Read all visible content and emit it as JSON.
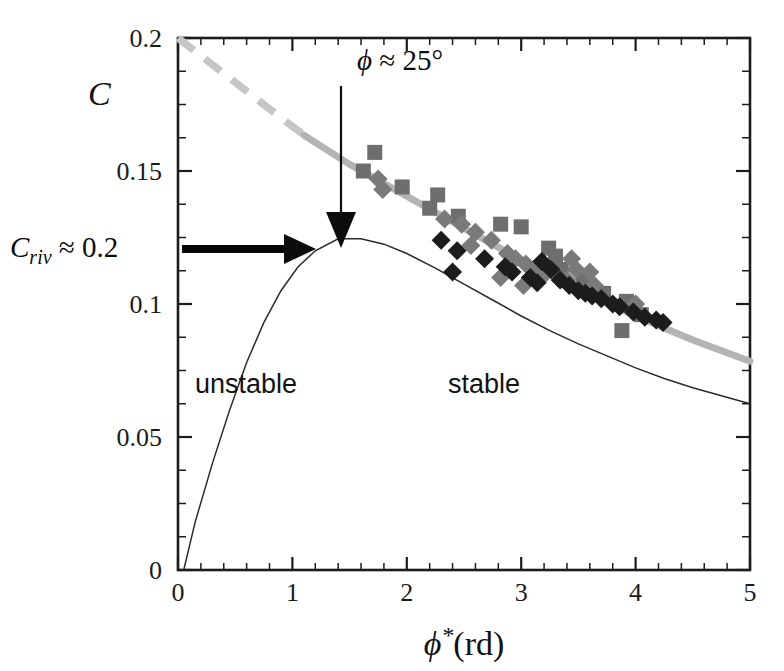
{
  "chart_data": {
    "type": "scatter",
    "title": "",
    "xlabel": "φ*(rd)",
    "ylabel": "C",
    "xlim": [
      0,
      5
    ],
    "ylim": [
      0,
      0.2
    ],
    "grid": false,
    "legend_position": "none",
    "x_ticks": [
      "0",
      "1",
      "2",
      "3",
      "4",
      "5"
    ],
    "x_tick_values": [
      0,
      1,
      2,
      3,
      4,
      5
    ],
    "x_minor_step": 0.2,
    "y_ticks": [
      "0",
      "0.05",
      "0.1",
      "0.15",
      "0.2"
    ],
    "y_tick_values": [
      0,
      0.05,
      0.1,
      0.15,
      0.2
    ],
    "y_minor_step": 0.0125,
    "annotations": [
      {
        "name": "phi-critical",
        "text": "ϕ ≈ 25°",
        "x": 2.0,
        "y": 0.188,
        "arrow_from": [
          2.0,
          0.175
        ],
        "arrow_to": [
          2.0,
          0.124
        ]
      },
      {
        "name": "c-riv",
        "text": "Cᵣᵢᵥ ≈ 0.2",
        "x": -0.9,
        "y": 0.125,
        "arrow_from": [
          0.04,
          0.125
        ],
        "arrow_to": [
          1.05,
          0.125
        ]
      },
      {
        "name": "unstable-region",
        "text": "unstable",
        "x": 0.95,
        "y": 0.063
      },
      {
        "name": "stable-region",
        "text": "stable",
        "x": 3.1,
        "y": 0.063
      }
    ],
    "series": [
      {
        "name": "Gray squares (experiment set A)",
        "marker": "square",
        "color": "#6e6e6e",
        "points": [
          [
            1.72,
            0.157
          ],
          [
            1.62,
            0.15
          ],
          [
            1.96,
            0.144
          ],
          [
            2.27,
            0.141
          ],
          [
            2.2,
            0.136
          ],
          [
            2.45,
            0.133
          ],
          [
            2.82,
            0.13
          ],
          [
            3.0,
            0.129
          ],
          [
            3.24,
            0.121
          ],
          [
            3.3,
            0.118
          ],
          [
            3.35,
            0.113
          ],
          [
            3.54,
            0.109
          ],
          [
            3.72,
            0.104
          ],
          [
            3.92,
            0.101
          ],
          [
            4.05,
            0.096
          ],
          [
            3.88,
            0.09
          ]
        ]
      },
      {
        "name": "Gray diamonds (experiment set B)",
        "marker": "diamond",
        "color": "#7a7a7a",
        "points": [
          [
            1.75,
            0.147
          ],
          [
            1.79,
            0.143
          ],
          [
            2.33,
            0.132
          ],
          [
            2.48,
            0.13
          ],
          [
            2.6,
            0.127
          ],
          [
            2.74,
            0.124
          ],
          [
            2.56,
            0.122
          ],
          [
            2.88,
            0.119
          ],
          [
            2.95,
            0.117
          ],
          [
            3.04,
            0.115
          ],
          [
            3.11,
            0.113
          ],
          [
            3.2,
            0.111
          ],
          [
            3.44,
            0.117
          ],
          [
            3.48,
            0.113
          ],
          [
            3.4,
            0.109
          ],
          [
            3.64,
            0.107
          ],
          [
            3.02,
            0.107
          ],
          [
            2.82,
            0.11
          ],
          [
            3.6,
            0.112
          ],
          [
            4.0,
            0.1
          ]
        ]
      },
      {
        "name": "Black diamonds (experiment set C)",
        "marker": "diamond",
        "color": "#1c1c1c",
        "points": [
          [
            2.3,
            0.124
          ],
          [
            2.44,
            0.12
          ],
          [
            2.68,
            0.117
          ],
          [
            2.86,
            0.114
          ],
          [
            2.92,
            0.112
          ],
          [
            3.08,
            0.11
          ],
          [
            3.14,
            0.108
          ],
          [
            3.18,
            0.116
          ],
          [
            3.26,
            0.113
          ],
          [
            3.34,
            0.109
          ],
          [
            3.42,
            0.107
          ],
          [
            3.5,
            0.105
          ],
          [
            3.56,
            0.104
          ],
          [
            3.62,
            0.103
          ],
          [
            3.7,
            0.102
          ],
          [
            3.8,
            0.1
          ],
          [
            3.98,
            0.097
          ],
          [
            4.08,
            0.095
          ],
          [
            4.18,
            0.094
          ],
          [
            4.24,
            0.093
          ],
          [
            2.4,
            0.112
          ],
          [
            3.86,
            0.099
          ]
        ]
      }
    ],
    "curves": [
      {
        "name": "fit-line-dashed-extrapolation",
        "style": "dashed",
        "color": "#c6c6c6",
        "points": [
          [
            0.0,
            0.2
          ],
          [
            0.3,
            0.19
          ],
          [
            0.6,
            0.18
          ],
          [
            0.9,
            0.17
          ],
          [
            1.15,
            0.162
          ]
        ]
      },
      {
        "name": "fit-line-solid",
        "style": "solid",
        "color": "#b4b4b4",
        "points": [
          [
            1.1,
            0.1635
          ],
          [
            1.5,
            0.1525
          ],
          [
            2.0,
            0.1405
          ],
          [
            2.5,
            0.1285
          ],
          [
            3.0,
            0.1165
          ],
          [
            3.5,
            0.1055
          ],
          [
            4.0,
            0.0955
          ],
          [
            4.5,
            0.0865
          ],
          [
            5.0,
            0.0785
          ]
        ]
      },
      {
        "name": "theoretical-stability-curve",
        "style": "thin",
        "color": "#2b2b2b",
        "points": [
          [
            0.05,
            0.0
          ],
          [
            0.15,
            0.018
          ],
          [
            0.3,
            0.04
          ],
          [
            0.45,
            0.06
          ],
          [
            0.6,
            0.078
          ],
          [
            0.75,
            0.093
          ],
          [
            0.9,
            0.105
          ],
          [
            1.05,
            0.114
          ],
          [
            1.2,
            0.12
          ],
          [
            1.4,
            0.1245
          ],
          [
            1.6,
            0.1245
          ],
          [
            1.8,
            0.1225
          ],
          [
            2.0,
            0.119
          ],
          [
            2.25,
            0.1135
          ],
          [
            2.5,
            0.1075
          ],
          [
            2.75,
            0.1015
          ],
          [
            3.0,
            0.0955
          ],
          [
            3.25,
            0.09
          ],
          [
            3.5,
            0.085
          ],
          [
            3.75,
            0.0805
          ],
          [
            4.0,
            0.076
          ],
          [
            4.25,
            0.072
          ],
          [
            4.5,
            0.0685
          ],
          [
            4.75,
            0.0655
          ],
          [
            5.0,
            0.0625
          ]
        ]
      }
    ]
  }
}
